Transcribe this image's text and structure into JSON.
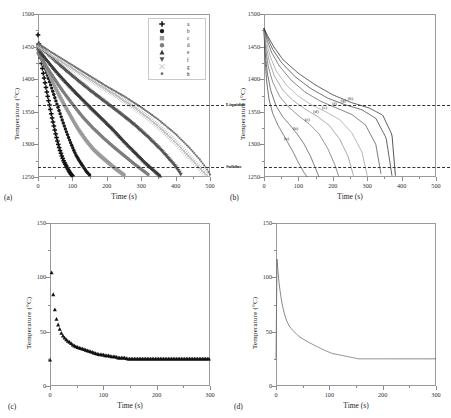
{
  "figure": {
    "panels": [
      {
        "key": "a",
        "label": "(a)"
      },
      {
        "key": "b",
        "label": "(b)"
      },
      {
        "key": "c",
        "label": "(c)"
      },
      {
        "key": "d",
        "label": "(d)"
      }
    ]
  },
  "axis_text": {
    "time": "Time (s)",
    "temperature": "Temperature (°C)"
  },
  "annotations": {
    "liquidus": "Liquidus",
    "solidus": "Solidus"
  },
  "legend_a": {
    "items": [
      {
        "label": "a",
        "marker": "plus",
        "color": "#111111"
      },
      {
        "label": "b",
        "marker": "circle",
        "color": "#1a1a1a"
      },
      {
        "label": "c",
        "marker": "square",
        "color": "#9a9a9a"
      },
      {
        "label": "d",
        "marker": "circle",
        "color": "#7d7d7d"
      },
      {
        "label": "e",
        "marker": "triangle",
        "color": "#3a3a3a"
      },
      {
        "label": "f",
        "marker": "triangle-down",
        "color": "#555555"
      },
      {
        "label": "g",
        "marker": "cross",
        "color": "#bdbdbd"
      },
      {
        "label": "h",
        "marker": "dot",
        "color": "#6e6e6e"
      }
    ]
  },
  "curve_labels_b": [
    "(a)",
    "(b)",
    "(c)",
    "(d)",
    "(e)",
    "(f)",
    "(g)",
    "(h)"
  ],
  "chart_data": [
    {
      "panel": "a",
      "type": "scatter",
      "title": "",
      "xlabel": "Time (s)",
      "ylabel": "Temperature (°C)",
      "xlim": [
        0,
        500
      ],
      "ylim": [
        1250,
        1500
      ],
      "xticks": [
        0,
        100,
        200,
        300,
        400,
        500
      ],
      "yticks": [
        1250,
        1300,
        1350,
        1400,
        1450,
        1500
      ],
      "grid": false,
      "legend_position": "top-right",
      "reference_lines": [
        {
          "label": "Liquidus",
          "y": 1361
        },
        {
          "label": "Solidus",
          "y": 1266
        }
      ],
      "series": [
        {
          "name": "a",
          "marker": "plus",
          "color": "#111111",
          "x": [
            0,
            5,
            10,
            15,
            20,
            25,
            30,
            35,
            40,
            45,
            50,
            55,
            60,
            65,
            70,
            75,
            80,
            85,
            90,
            95,
            100
          ],
          "y": [
            1468,
            1441,
            1425,
            1410,
            1396,
            1382,
            1369,
            1356,
            1343,
            1331,
            1319,
            1308,
            1298,
            1289,
            1281,
            1274,
            1269,
            1264,
            1259,
            1255,
            1252
          ]
        },
        {
          "name": "b",
          "marker": "circle",
          "color": "#1a1a1a",
          "x": [
            0,
            10,
            20,
            30,
            40,
            50,
            60,
            70,
            80,
            90,
            100,
            110,
            120,
            130,
            140,
            150
          ],
          "y": [
            1452,
            1434,
            1418,
            1402,
            1386,
            1370,
            1354,
            1338,
            1323,
            1309,
            1296,
            1284,
            1275,
            1267,
            1259,
            1253
          ]
        },
        {
          "name": "c",
          "marker": "square",
          "color": "#9a9a9a",
          "x": [
            0,
            15,
            30,
            45,
            60,
            75,
            90,
            105,
            120,
            140,
            160,
            180,
            200,
            220,
            240,
            250
          ],
          "y": [
            1448,
            1428,
            1410,
            1393,
            1377,
            1362,
            1348,
            1334,
            1321,
            1306,
            1293,
            1283,
            1274,
            1265,
            1257,
            1253
          ]
        },
        {
          "name": "d",
          "marker": "circle",
          "color": "#7d7d7d",
          "x": [
            0,
            20,
            40,
            60,
            80,
            100,
            130,
            160,
            190,
            220,
            250,
            280,
            300,
            320
          ],
          "y": [
            1440,
            1423,
            1407,
            1391,
            1376,
            1362,
            1342,
            1325,
            1310,
            1296,
            1283,
            1270,
            1262,
            1254
          ]
        },
        {
          "name": "e",
          "marker": "triangle",
          "color": "#3a3a3a",
          "x": [
            0,
            25,
            50,
            75,
            100,
            130,
            160,
            190,
            220,
            250,
            280,
            310,
            340,
            355
          ],
          "y": [
            1447,
            1430,
            1414,
            1399,
            1385,
            1369,
            1353,
            1338,
            1322,
            1305,
            1289,
            1273,
            1259,
            1252
          ]
        },
        {
          "name": "f",
          "marker": "triangle-down",
          "color": "#555555",
          "x": [
            0,
            30,
            60,
            90,
            120,
            160,
            200,
            240,
            280,
            320,
            360,
            400,
            415
          ],
          "y": [
            1452,
            1437,
            1423,
            1409,
            1396,
            1379,
            1363,
            1347,
            1330,
            1311,
            1290,
            1266,
            1254
          ]
        },
        {
          "name": "g",
          "marker": "cross",
          "color": "#bdbdbd",
          "x": [
            0,
            40,
            80,
            120,
            160,
            200,
            240,
            280,
            320,
            360,
            400,
            440,
            470,
            490
          ],
          "y": [
            1450,
            1436,
            1423,
            1410,
            1397,
            1384,
            1371,
            1357,
            1341,
            1323,
            1303,
            1281,
            1264,
            1253
          ]
        },
        {
          "name": "h",
          "marker": "dot",
          "color": "#6e6e6e",
          "x": [
            0,
            40,
            80,
            120,
            160,
            200,
            250,
            300,
            350,
            400,
            440,
            470,
            490,
            500
          ],
          "y": [
            1455,
            1441,
            1428,
            1415,
            1402,
            1389,
            1374,
            1357,
            1338,
            1316,
            1295,
            1277,
            1263,
            1254
          ]
        }
      ]
    },
    {
      "panel": "b",
      "type": "line",
      "title": "",
      "xlabel": "Time (s)",
      "ylabel": "Temperature (°C)",
      "xlim": [
        0,
        500
      ],
      "ylim": [
        1250,
        1500
      ],
      "xticks": [
        0,
        100,
        200,
        300,
        400,
        500
      ],
      "yticks": [
        1250,
        1300,
        1350,
        1400,
        1450,
        1500
      ],
      "grid": false,
      "reference_lines": [
        {
          "label": "Liquidus",
          "y": 1361
        },
        {
          "label": "Solidus",
          "y": 1266
        }
      ],
      "series": [
        {
          "name": "(a)",
          "color": "#4a4a4a",
          "x": [
            0,
            3,
            8,
            15,
            25,
            40,
            55,
            70,
            85,
            100,
            115,
            125
          ],
          "y": [
            1478,
            1430,
            1395,
            1368,
            1348,
            1330,
            1316,
            1302,
            1288,
            1272,
            1258,
            1250
          ]
        },
        {
          "name": "(b)",
          "color": "#4a4a4a",
          "x": [
            0,
            3,
            10,
            20,
            35,
            55,
            75,
            95,
            115,
            135,
            150,
            160
          ],
          "y": [
            1478,
            1442,
            1408,
            1382,
            1359,
            1342,
            1330,
            1317,
            1302,
            1282,
            1263,
            1250
          ]
        },
        {
          "name": "(c)",
          "color": "#6a6a6a",
          "x": [
            0,
            4,
            12,
            25,
            45,
            70,
            100,
            130,
            160,
            185,
            205,
            218
          ],
          "y": [
            1478,
            1450,
            1420,
            1396,
            1374,
            1358,
            1344,
            1332,
            1316,
            1294,
            1270,
            1250
          ]
        },
        {
          "name": "(d)",
          "color": "#8a8a8a",
          "x": [
            0,
            5,
            15,
            30,
            55,
            85,
            120,
            155,
            190,
            220,
            245,
            260
          ],
          "y": [
            1478,
            1455,
            1428,
            1405,
            1383,
            1367,
            1354,
            1343,
            1329,
            1308,
            1281,
            1252
          ]
        },
        {
          "name": "(e)",
          "color": "#a0a0a0",
          "x": [
            0,
            6,
            18,
            35,
            65,
            100,
            140,
            180,
            220,
            255,
            285,
            300
          ],
          "y": [
            1478,
            1460,
            1435,
            1413,
            1391,
            1374,
            1360,
            1350,
            1338,
            1318,
            1288,
            1252
          ]
        },
        {
          "name": "(f)",
          "color": "#555555",
          "x": [
            0,
            7,
            22,
            45,
            80,
            120,
            165,
            210,
            255,
            295,
            325,
            340
          ],
          "y": [
            1478,
            1463,
            1441,
            1420,
            1398,
            1380,
            1366,
            1356,
            1346,
            1330,
            1300,
            1255
          ]
        },
        {
          "name": "(g)",
          "color": "#3a3a3a",
          "x": [
            0,
            8,
            25,
            50,
            90,
            135,
            185,
            235,
            285,
            325,
            355,
            372
          ],
          "y": [
            1478,
            1466,
            1446,
            1426,
            1404,
            1386,
            1371,
            1361,
            1353,
            1340,
            1310,
            1252
          ]
        },
        {
          "name": "(h)",
          "color": "#2a2a2a",
          "x": [
            0,
            9,
            28,
            55,
            100,
            150,
            200,
            255,
            305,
            345,
            372,
            382
          ],
          "y": [
            1478,
            1468,
            1450,
            1430,
            1409,
            1391,
            1376,
            1364,
            1356,
            1345,
            1315,
            1252
          ]
        }
      ]
    },
    {
      "panel": "c",
      "type": "scatter",
      "title": "",
      "xlabel": "Time (s)",
      "ylabel": "Temperature (°C)",
      "xlim": [
        0,
        300
      ],
      "ylim": [
        0,
        150
      ],
      "xticks": [
        0,
        100,
        200,
        300
      ],
      "yticks": [
        0,
        50,
        100,
        150
      ],
      "grid": false,
      "series": [
        {
          "name": "cooling",
          "marker": "triangle",
          "color": "#111111",
          "x": [
            0,
            2,
            5,
            8,
            11,
            14,
            17,
            20,
            23,
            26,
            30,
            34,
            38,
            42,
            46,
            50,
            56,
            62,
            68,
            74,
            80,
            86,
            92,
            98,
            104,
            110,
            116,
            122,
            128,
            134,
            140,
            146,
            152,
            160,
            170,
            180,
            190,
            200,
            210,
            220,
            230,
            240,
            250,
            260,
            270,
            280,
            290,
            298
          ],
          "y": [
            24,
            112,
            90,
            74,
            64,
            58,
            54,
            50,
            47,
            45,
            43,
            41,
            40,
            38,
            37,
            36,
            35,
            34,
            33,
            32,
            31,
            30,
            29,
            29,
            28,
            28,
            27,
            27,
            26,
            26,
            26,
            25,
            25,
            25,
            25,
            25,
            25,
            25,
            25,
            25,
            25,
            25,
            25,
            25,
            25,
            25,
            25,
            25
          ]
        }
      ]
    },
    {
      "panel": "d",
      "type": "line",
      "title": "",
      "xlabel": "Time (s)",
      "ylabel": "Temperature (°C)",
      "xlim": [
        0,
        300
      ],
      "ylim": [
        0,
        150
      ],
      "xticks": [
        0,
        100,
        200,
        300
      ],
      "yticks": [
        0,
        50,
        100,
        150
      ],
      "grid": false,
      "series": [
        {
          "name": "cooling",
          "color": "#6a6a6a",
          "x": [
            0,
            1,
            3,
            5,
            8,
            12,
            16,
            20,
            25,
            30,
            36,
            42,
            48,
            55,
            62,
            70,
            78,
            86,
            95,
            105,
            115,
            125,
            135,
            145,
            155,
            170,
            190,
            210,
            230,
            250,
            270,
            290,
            300
          ],
          "y": [
            24,
            122,
            110,
            98,
            86,
            74,
            66,
            60,
            55,
            52,
            49,
            46,
            44,
            42,
            40,
            38,
            36,
            34,
            32,
            30,
            29,
            28,
            27,
            26,
            25,
            25,
            25,
            25,
            25,
            25,
            25,
            25,
            25
          ]
        }
      ]
    }
  ]
}
